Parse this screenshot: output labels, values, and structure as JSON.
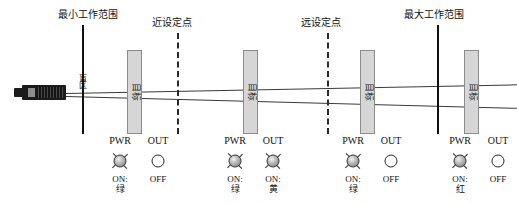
{
  "diagram": {
    "sensor": {
      "name": "ultrasonic-sensor"
    },
    "blind_zone_label": "盲区",
    "boundaries": [
      {
        "id": "min-range",
        "caption": "最小工作范围",
        "x": 82
      },
      {
        "id": "max-range",
        "caption": "最大工作范围",
        "x": 437
      }
    ],
    "setpoints": [
      {
        "id": "near-setpoint",
        "caption": "近设定点",
        "x": 177
      },
      {
        "id": "far-setpoint",
        "caption": "远设定点",
        "x": 327
      }
    ],
    "targets": [
      {
        "id": "target-1",
        "label": "目标",
        "x": 127
      },
      {
        "id": "target-2",
        "label": "目标",
        "x": 243
      },
      {
        "id": "target-3",
        "label": "目标",
        "x": 360
      },
      {
        "id": "target-4",
        "label": "目标",
        "x": 464
      }
    ]
  },
  "indicators": {
    "header_power": "PWR",
    "header_output": "OUT",
    "on_label": "ON:",
    "off_label": "OFF",
    "groups": [
      {
        "id": "indicator-group-1",
        "x": 100,
        "power": {
          "state": "on",
          "state_label": "ON:",
          "color_label": "绿",
          "lit": true
        },
        "output": {
          "state": "off",
          "state_label": "OFF",
          "color_label": "",
          "lit": false
        }
      },
      {
        "id": "indicator-group-2",
        "x": 215,
        "power": {
          "state": "on",
          "state_label": "ON:",
          "color_label": "绿",
          "lit": true
        },
        "output": {
          "state": "on",
          "state_label": "ON:",
          "color_label": "黄",
          "lit": true
        }
      },
      {
        "id": "indicator-group-3",
        "x": 333,
        "power": {
          "state": "on",
          "state_label": "ON:",
          "color_label": "绿",
          "lit": true
        },
        "output": {
          "state": "off",
          "state_label": "OFF",
          "color_label": "",
          "lit": false
        }
      },
      {
        "id": "indicator-group-4",
        "x": 440,
        "power": {
          "state": "on",
          "state_label": "ON:",
          "color_label": "红",
          "lit": true
        },
        "output": {
          "state": "off",
          "state_label": "OFF",
          "color_label": "",
          "lit": false
        }
      }
    ]
  }
}
